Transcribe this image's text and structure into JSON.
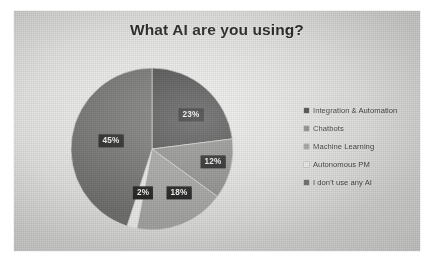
{
  "slide": {
    "background_color": "#e3e3e1",
    "margin_color": "#ffffff"
  },
  "chart_data": {
    "type": "pie",
    "title": "What AI are you using?",
    "categories": [
      "Integration & Automation",
      "Chatbots",
      "Machine Learning",
      "Autonomous PM",
      "I don't use any AI"
    ],
    "values": [
      23,
      12,
      18,
      2,
      45
    ],
    "value_labels": [
      "23%",
      "12%",
      "18%",
      "2%",
      "45%"
    ],
    "colors": [
      "#4a4a4a",
      "#8e8e8c",
      "#a3a3a1",
      "#e8e8e6",
      "#6f6f6d"
    ],
    "legend_position": "right",
    "grid": false,
    "start_angle_deg": 0,
    "direction": "clockwise",
    "label_style": {
      "background": "#1d1d1d",
      "text_color": "#f0f0ee"
    },
    "slices": [
      {
        "label": "Integration & Automation",
        "value": 23,
        "value_label": "23%",
        "color": "#4a4a4a",
        "label_x": 191,
        "label_y": 115
      },
      {
        "label": "Chatbots",
        "value": 12,
        "value_label": "12%",
        "color": "#8e8e8c",
        "label_x": 213,
        "label_y": 162
      },
      {
        "label": "Machine Learning",
        "value": 18,
        "value_label": "18%",
        "color": "#a3a3a1",
        "label_x": 179,
        "label_y": 193
      },
      {
        "label": "Autonomous PM",
        "value": 2,
        "value_label": "2%",
        "color": "#e8e8e6",
        "label_x": 143,
        "label_y": 193
      },
      {
        "label": "I don't use any AI",
        "value": 45,
        "value_label": "45%",
        "color": "#6f6f6d",
        "label_x": 111,
        "label_y": 141
      }
    ]
  }
}
